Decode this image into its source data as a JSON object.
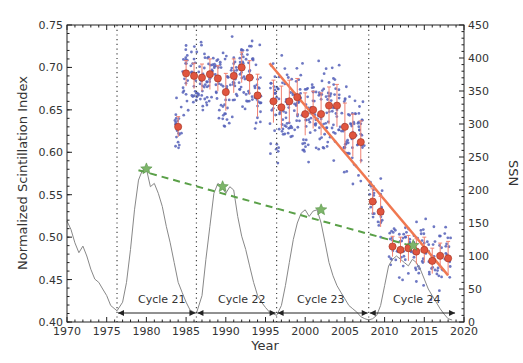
{
  "chart_data": {
    "type": "scatter",
    "title": "",
    "xlabel": "Year",
    "ylabel": "Normalized Scintillation Index",
    "y2label": "SSN",
    "xlim": [
      1970,
      2020
    ],
    "ylim": [
      0.4,
      0.75
    ],
    "y2lim": [
      0,
      450
    ],
    "grid": false,
    "x_ticks": [
      "1970",
      "1975",
      "1980",
      "1985",
      "1990",
      "1995",
      "2000",
      "2005",
      "2010",
      "2015",
      "2020"
    ],
    "y_ticks": [
      "0.40",
      "0.45",
      "0.50",
      "0.55",
      "0.60",
      "0.65",
      "0.70",
      "0.75"
    ],
    "y2_ticks": [
      "0",
      "50",
      "100",
      "150",
      "200",
      "250",
      "300",
      "350",
      "400",
      "450"
    ],
    "cycle_boundaries": [
      1976.3,
      1986.3,
      1996.4,
      2008.0
    ],
    "cycles": [
      {
        "label": "Cycle 21",
        "start": 1976.3,
        "end": 1986.3
      },
      {
        "label": "Cycle 22",
        "start": 1986.3,
        "end": 1996.4
      },
      {
        "label": "Cycle 23",
        "start": 1996.4,
        "end": 2008.0
      },
      {
        "label": "Cycle 24",
        "start": 2008.0,
        "end": 2019.0
      }
    ],
    "series": [
      {
        "name": "Annual mean scintillation index",
        "axis": "left",
        "color": "#e0553f",
        "x": [
          1984,
          1985,
          1986,
          1987,
          1988,
          1989,
          1990,
          1991,
          1992,
          1993,
          1994,
          1996,
          1997,
          1998,
          1999,
          2000,
          2001,
          2002,
          2003,
          2004,
          2005,
          2006,
          2007,
          2008.5,
          2009.5,
          2011,
          2012,
          2013,
          2014,
          2015,
          2016,
          2017,
          2018
        ],
        "y": [
          0.63,
          0.693,
          0.69,
          0.688,
          0.692,
          0.687,
          0.671,
          0.69,
          0.7,
          0.688,
          0.667,
          0.66,
          0.653,
          0.66,
          0.665,
          0.645,
          0.65,
          0.645,
          0.655,
          0.655,
          0.63,
          0.62,
          0.612,
          0.542,
          0.53,
          0.489,
          0.485,
          0.487,
          0.483,
          0.485,
          0.472,
          0.478,
          0.475
        ],
        "err": [
          0.012,
          0.015,
          0.015,
          0.016,
          0.018,
          0.015,
          0.022,
          0.02,
          0.018,
          0.02,
          0.025,
          0.025,
          0.025,
          0.025,
          0.022,
          0.025,
          0.022,
          0.025,
          0.022,
          0.025,
          0.028,
          0.025,
          0.025,
          0.015,
          0.018,
          0.012,
          0.015,
          0.015,
          0.015,
          0.015,
          0.015,
          0.015,
          0.02
        ]
      },
      {
        "name": "Linear fit (post-1995)",
        "axis": "left",
        "color": "#f07850",
        "x": [
          1995.5,
          2018.0
        ],
        "y": [
          0.705,
          0.455
        ]
      },
      {
        "name": "Sunspot cycle peak trend",
        "axis": "right",
        "color": "#5aa048",
        "style": "dashed",
        "x": [
          1979.0,
          2013.5
        ],
        "y": [
          230,
          115
        ]
      },
      {
        "name": "Cycle maxima",
        "axis": "right",
        "color": "#7db56a",
        "marker": "star",
        "x": [
          1980.0,
          1989.6,
          2002.0,
          2013.6
        ],
        "y": [
          232,
          205,
          170,
          116
        ]
      },
      {
        "name": "Smoothed SSN",
        "axis": "right",
        "color": "#888888",
        "x": [
          1970.0,
          1970.5,
          1971.0,
          1971.5,
          1972.0,
          1972.5,
          1973.0,
          1973.5,
          1974.0,
          1974.5,
          1975.0,
          1975.5,
          1976.3,
          1977.0,
          1977.5,
          1978.0,
          1978.5,
          1979.0,
          1979.5,
          1980.0,
          1980.5,
          1981.0,
          1981.5,
          1982.0,
          1982.5,
          1983.0,
          1983.5,
          1984.0,
          1984.5,
          1985.0,
          1985.5,
          1986.3,
          1987.0,
          1987.5,
          1988.0,
          1988.5,
          1989.0,
          1989.5,
          1990.0,
          1990.5,
          1991.0,
          1991.5,
          1992.0,
          1992.5,
          1993.0,
          1993.5,
          1994.0,
          1994.5,
          1995.0,
          1995.5,
          1996.4,
          1997.0,
          1997.5,
          1998.0,
          1998.5,
          1999.0,
          1999.5,
          2000.0,
          2000.5,
          2001.0,
          2001.5,
          2002.0,
          2002.5,
          2003.0,
          2003.5,
          2004.0,
          2004.5,
          2005.0,
          2005.5,
          2006.0,
          2006.5,
          2007.0,
          2007.5,
          2008.0,
          2008.5,
          2009.0,
          2009.5,
          2010.0,
          2010.5,
          2011.0,
          2011.5,
          2012.0,
          2012.5,
          2013.0,
          2013.5,
          2014.0,
          2014.5,
          2015.0,
          2015.5,
          2016.0,
          2016.5,
          2017.0,
          2017.5,
          2018.0,
          2018.5
        ],
        "y": [
          153,
          140,
          120,
          105,
          115,
          100,
          80,
          65,
          60,
          50,
          40,
          25,
          17,
          30,
          60,
          110,
          170,
          215,
          230,
          232,
          205,
          210,
          195,
          175,
          145,
          120,
          90,
          60,
          45,
          30,
          18,
          13,
          40,
          95,
          145,
          195,
          210,
          205,
          195,
          205,
          200,
          160,
          130,
          110,
          85,
          60,
          40,
          30,
          22,
          15,
          10,
          25,
          55,
          90,
          125,
          150,
          165,
          170,
          160,
          168,
          170,
          150,
          120,
          90,
          70,
          55,
          45,
          35,
          25,
          20,
          15,
          8,
          5,
          3,
          5,
          10,
          25,
          55,
          85,
          95,
          100,
          95,
          90,
          85,
          95,
          90,
          80,
          65,
          50,
          40,
          30,
          20,
          12,
          5,
          3
        ]
      }
    ]
  },
  "labels": {
    "xlabel": "Year",
    "ylabel": "Normalized Scintillation Index",
    "y2label": "SSN",
    "cycle_21": "Cycle 21",
    "cycle_22": "Cycle 22",
    "cycle_23": "Cycle 23",
    "cycle_24": "Cycle 24"
  }
}
